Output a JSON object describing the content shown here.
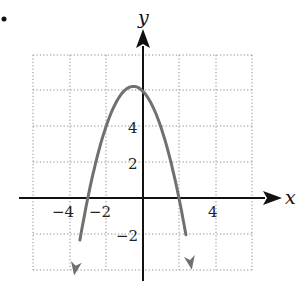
{
  "chart_data": {
    "type": "line",
    "title": "",
    "xlabel": "x",
    "ylabel": "y",
    "xlim": [
      -6,
      6
    ],
    "ylim": [
      -4,
      8
    ],
    "grid": true,
    "grid_style": "dotted",
    "grid_step": 2,
    "x_ticks": [
      -4,
      -2,
      4
    ],
    "x_tick_labels": [
      "−4",
      "−2",
      "4"
    ],
    "y_ticks": [
      4,
      2,
      -2
    ],
    "y_tick_labels": [
      "4",
      "2",
      "−2"
    ],
    "legend": null,
    "series": [
      {
        "name": "parabola",
        "description": "downward-opening parabola with arrowheads on both ends",
        "equation_estimate": "y = -x^2 - x + 6",
        "vertex": [
          -0.5,
          6.25
        ],
        "x_intercepts": [
          -3,
          2
        ],
        "y_intercept": 6,
        "x_range": [
          -3.75,
          2.7
        ],
        "color": "#707070",
        "points": [
          [
            -3.75,
            -4.3
          ],
          [
            -3.5,
            -2.75
          ],
          [
            -3,
            0
          ],
          [
            -2.5,
            2.25
          ],
          [
            -2,
            4
          ],
          [
            -1.5,
            5.25
          ],
          [
            -1,
            6
          ],
          [
            -0.5,
            6.25
          ],
          [
            0,
            6
          ],
          [
            0.5,
            5.25
          ],
          [
            1,
            4
          ],
          [
            1.5,
            2.25
          ],
          [
            2,
            0
          ],
          [
            2.5,
            -2.75
          ],
          [
            2.7,
            -4.0
          ]
        ]
      }
    ]
  },
  "labels": {
    "x_axis": "x",
    "y_axis": "y",
    "tick_neg4": "−4",
    "tick_neg2_x": "−2",
    "tick_4_x": "4",
    "tick_4_y": "4",
    "tick_2_y": "2",
    "tick_neg2_y": "−2"
  },
  "colors": {
    "axis": "#111111",
    "grid": "#8a8a8a",
    "curve": "#707070"
  }
}
